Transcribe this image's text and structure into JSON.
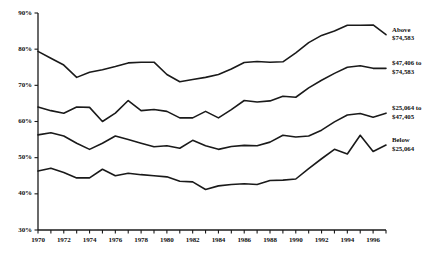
{
  "chart_data": {
    "type": "line",
    "title": "",
    "subtitle": "",
    "xlabel": "",
    "ylabel": "",
    "xlim": [
      1970,
      1997
    ],
    "ylim": [
      30,
      90
    ],
    "ytick_format": "percent",
    "grid": false,
    "legend_position": "right-inline-labels",
    "x": [
      1970,
      1971,
      1972,
      1973,
      1974,
      1975,
      1976,
      1977,
      1978,
      1979,
      1980,
      1981,
      1982,
      1983,
      1984,
      1985,
      1986,
      1987,
      1988,
      1989,
      1990,
      1991,
      1992,
      1993,
      1994,
      1995,
      1996,
      1997
    ],
    "yticks": [
      30,
      40,
      50,
      60,
      70,
      80,
      90
    ],
    "ytick_labels": [
      "30%",
      "40%",
      "50%",
      "60%",
      "70%",
      "80%",
      "90%"
    ],
    "xticks": [
      1970,
      1971,
      1972,
      1973,
      1974,
      1975,
      1976,
      1977,
      1978,
      1979,
      1980,
      1981,
      1982,
      1983,
      1984,
      1985,
      1986,
      1987,
      1988,
      1989,
      1990,
      1991,
      1992,
      1993,
      1994,
      1995,
      1996,
      1997
    ],
    "xtick_labels": [
      "1970",
      "",
      "1972",
      "",
      "1974",
      "",
      "1976",
      "",
      "1978",
      "",
      "1980",
      "",
      "1982",
      "",
      "1984",
      "",
      "1986",
      "",
      "1988",
      "",
      "1990",
      "",
      "1992",
      "",
      "1994",
      "",
      "1996",
      ""
    ],
    "series": [
      {
        "name": "Above $74,583",
        "label_lines": [
          "Above",
          "$74,583"
        ],
        "color": "#1a1a1a",
        "values": [
          79.4,
          77.5,
          75.6,
          72.2,
          73.6,
          74.3,
          75.2,
          76.2,
          76.4,
          76.4,
          73.0,
          71.0,
          71.6,
          72.2,
          73.0,
          74.5,
          76.3,
          76.6,
          76.4,
          76.5,
          79.0,
          81.8,
          83.8,
          85.0,
          86.6,
          86.6,
          86.7,
          84.0
        ]
      },
      {
        "name": "$47,406 to $74,583",
        "label_lines": [
          "$47,406 to",
          "$74,583"
        ],
        "color": "#1a1a1a",
        "values": [
          64.0,
          63.0,
          62.3,
          64.0,
          63.9,
          60.0,
          62.3,
          65.8,
          63.0,
          63.3,
          62.8,
          61.0,
          61.0,
          62.8,
          61.0,
          63.3,
          65.8,
          65.4,
          65.7,
          67.0,
          66.7,
          69.3,
          71.4,
          73.3,
          75.0,
          75.4,
          74.7,
          74.7
        ]
      },
      {
        "name": "$25,064 to $47,405",
        "label_lines": [
          "$25,064 to",
          "$47,405"
        ],
        "color": "#1a1a1a",
        "values": [
          56.3,
          56.9,
          56.0,
          54.0,
          52.3,
          54.0,
          56.0,
          55.0,
          54.0,
          53.0,
          53.3,
          52.6,
          54.8,
          53.3,
          52.3,
          53.1,
          53.4,
          53.3,
          54.3,
          56.2,
          55.7,
          56.0,
          57.6,
          59.9,
          61.8,
          62.2,
          61.2,
          62.3
        ]
      },
      {
        "name": "Below $25,064",
        "label_lines": [
          "Below",
          "$25,064"
        ],
        "color": "#1a1a1a",
        "values": [
          46.3,
          47.1,
          45.9,
          44.4,
          44.4,
          46.8,
          45.0,
          45.7,
          45.3,
          45.0,
          44.7,
          43.5,
          43.3,
          41.2,
          42.2,
          42.6,
          42.8,
          42.6,
          43.7,
          43.8,
          44.1,
          47.0,
          49.7,
          52.3,
          51.0,
          56.2,
          51.7,
          53.5
        ]
      }
    ]
  },
  "axis": {
    "y_labels": [
      "90%",
      "80%",
      "70%",
      "60%",
      "50%",
      "40%",
      "30%"
    ],
    "x_labels": [
      "1970",
      "1972",
      "1974",
      "1976",
      "1978",
      "1980",
      "1982",
      "1984",
      "1986",
      "1988",
      "1990",
      "1992",
      "1994",
      "1996"
    ]
  },
  "colors": {
    "line": "#1a1a1a",
    "axis": "#1a1a1a",
    "background": "#ffffff",
    "text": "#111111"
  }
}
